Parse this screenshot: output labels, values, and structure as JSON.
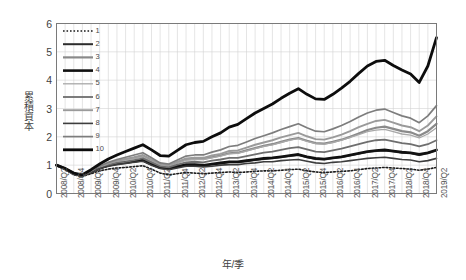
{
  "chart_data": {
    "type": "line",
    "title": "",
    "xlabel": "年/季",
    "ylabel": "累積資本",
    "ylim": [
      0,
      6
    ],
    "yticks": [
      0,
      1,
      2,
      3,
      4,
      5,
      6
    ],
    "grid": true,
    "legend_position": "top-left inside plot",
    "x": [
      "2008/Q2",
      "2008/Q3",
      "2008/Q4",
      "2009/Q1",
      "2009/Q2",
      "2009/Q3",
      "2009/Q4",
      "2010/Q1",
      "2010/Q2",
      "2010/Q3",
      "2010/Q4",
      "2011/Q1",
      "2011/Q2",
      "2011/Q3",
      "2011/Q4",
      "2012/Q1",
      "2012/Q2",
      "2012/Q3",
      "2012/Q4",
      "2013/Q1",
      "2013/Q2",
      "2013/Q3",
      "2013/Q4",
      "2014/Q1",
      "2014/Q2",
      "2014/Q3",
      "2014/Q4",
      "2015/Q1",
      "2015/Q2",
      "2015/Q3",
      "2015/Q4",
      "2016/Q1",
      "2016/Q2",
      "2016/Q3",
      "2016/Q4",
      "2017/Q1",
      "2017/Q2",
      "2017/Q3",
      "2017/Q4",
      "2018/Q1",
      "2018/Q2",
      "2018/Q3",
      "2018/Q4",
      "2019/Q1",
      "2019/Q2"
    ],
    "xtick_labels": [
      "2008/Q2",
      "2008/Q4",
      "2009/Q2",
      "2009/Q4",
      "2010/Q2",
      "2010/Q4",
      "2011/Q2",
      "2011/Q4",
      "2012/Q2",
      "2012/Q4",
      "2013/Q2",
      "2013/Q4",
      "2014/Q2",
      "2014/Q4",
      "2015/Q2",
      "2015/Q4",
      "2016/Q2",
      "2016/Q4",
      "2017/Q2",
      "2017/Q4",
      "2018/Q2",
      "2018/Q4",
      "2019/Q2"
    ],
    "series": [
      {
        "name": "1",
        "style": "dotted",
        "color": "#1a1a1a",
        "width": 1.6,
        "values": [
          1.0,
          0.84,
          0.66,
          0.6,
          0.7,
          0.8,
          0.86,
          0.9,
          0.92,
          0.95,
          0.98,
          0.86,
          0.72,
          0.66,
          0.7,
          0.74,
          0.72,
          0.7,
          0.72,
          0.74,
          0.76,
          0.74,
          0.76,
          0.78,
          0.8,
          0.8,
          0.82,
          0.84,
          0.86,
          0.8,
          0.76,
          0.74,
          0.76,
          0.78,
          0.8,
          0.84,
          0.88,
          0.9,
          0.92,
          0.9,
          0.88,
          0.86,
          0.82,
          0.86,
          0.92
        ]
      },
      {
        "name": "2",
        "style": "solid",
        "color": "#2d2d2d",
        "width": 2.0,
        "values": [
          1.0,
          0.86,
          0.68,
          0.62,
          0.74,
          0.88,
          0.98,
          1.04,
          1.08,
          1.12,
          1.16,
          1.02,
          0.9,
          0.86,
          0.94,
          1.0,
          1.0,
          0.98,
          1.02,
          1.06,
          1.1,
          1.1,
          1.14,
          1.18,
          1.22,
          1.24,
          1.28,
          1.32,
          1.36,
          1.28,
          1.22,
          1.2,
          1.24,
          1.28,
          1.34,
          1.4,
          1.46,
          1.5,
          1.52,
          1.48,
          1.44,
          1.42,
          1.36,
          1.42,
          1.52
        ]
      },
      {
        "name": "3",
        "style": "solid",
        "color": "#8a8a8a",
        "width": 2.2,
        "values": [
          1.0,
          0.87,
          0.7,
          0.64,
          0.78,
          0.94,
          1.06,
          1.14,
          1.2,
          1.26,
          1.32,
          1.16,
          1.02,
          0.98,
          1.1,
          1.2,
          1.22,
          1.22,
          1.28,
          1.34,
          1.42,
          1.44,
          1.52,
          1.6,
          1.68,
          1.74,
          1.82,
          1.9,
          1.96,
          1.86,
          1.78,
          1.76,
          1.82,
          1.9,
          2.0,
          2.12,
          2.24,
          2.32,
          2.36,
          2.28,
          2.2,
          2.16,
          2.04,
          2.2,
          2.46
        ]
      },
      {
        "name": "4",
        "style": "solid",
        "color": "#111111",
        "width": 2.6,
        "values": [
          1.0,
          0.88,
          0.7,
          0.64,
          0.76,
          0.9,
          1.0,
          1.06,
          1.1,
          1.14,
          1.18,
          1.04,
          0.92,
          0.88,
          0.96,
          1.02,
          1.02,
          1.0,
          1.04,
          1.08,
          1.12,
          1.12,
          1.16,
          1.2,
          1.24,
          1.26,
          1.3,
          1.34,
          1.38,
          1.3,
          1.24,
          1.22,
          1.26,
          1.3,
          1.36,
          1.42,
          1.48,
          1.52,
          1.54,
          1.5,
          1.46,
          1.44,
          1.38,
          1.44,
          1.54
        ]
      },
      {
        "name": "5",
        "style": "solid",
        "color": "#a8a8a8",
        "width": 1.3,
        "values": [
          1.0,
          0.87,
          0.69,
          0.63,
          0.77,
          0.92,
          1.04,
          1.12,
          1.18,
          1.24,
          1.3,
          1.14,
          1.0,
          0.96,
          1.08,
          1.18,
          1.2,
          1.2,
          1.26,
          1.32,
          1.4,
          1.42,
          1.5,
          1.58,
          1.66,
          1.72,
          1.8,
          1.88,
          1.94,
          1.84,
          1.76,
          1.74,
          1.8,
          1.88,
          1.98,
          2.08,
          2.18,
          2.24,
          2.26,
          2.18,
          2.1,
          2.06,
          1.96,
          2.1,
          2.32
        ]
      },
      {
        "name": "6",
        "style": "solid",
        "color": "#6e6e6e",
        "width": 1.8,
        "values": [
          1.0,
          0.86,
          0.68,
          0.62,
          0.75,
          0.9,
          1.0,
          1.08,
          1.12,
          1.18,
          1.24,
          1.1,
          0.96,
          0.92,
          1.02,
          1.1,
          1.12,
          1.1,
          1.16,
          1.2,
          1.26,
          1.26,
          1.32,
          1.38,
          1.44,
          1.48,
          1.54,
          1.6,
          1.64,
          1.56,
          1.48,
          1.46,
          1.52,
          1.58,
          1.66,
          1.74,
          1.82,
          1.88,
          1.9,
          1.84,
          1.78,
          1.74,
          1.66,
          1.74,
          1.88
        ]
      },
      {
        "name": "7",
        "style": "solid",
        "color": "#9a9a9a",
        "width": 1.9,
        "values": [
          1.0,
          0.87,
          0.7,
          0.64,
          0.78,
          0.94,
          1.06,
          1.16,
          1.22,
          1.28,
          1.36,
          1.2,
          1.04,
          1.0,
          1.12,
          1.24,
          1.26,
          1.26,
          1.34,
          1.4,
          1.5,
          1.52,
          1.62,
          1.72,
          1.8,
          1.88,
          1.98,
          2.06,
          2.14,
          2.02,
          1.92,
          1.9,
          1.98,
          2.08,
          2.2,
          2.34,
          2.46,
          2.56,
          2.6,
          2.5,
          2.4,
          2.34,
          2.2,
          2.4,
          2.72
        ]
      },
      {
        "name": "8",
        "style": "solid",
        "color": "#3d3d3d",
        "width": 1.6,
        "values": [
          1.0,
          0.86,
          0.68,
          0.62,
          0.74,
          0.88,
          0.96,
          1.02,
          1.06,
          1.1,
          1.14,
          1.0,
          0.88,
          0.84,
          0.9,
          0.96,
          0.96,
          0.94,
          0.96,
          1.0,
          1.02,
          1.02,
          1.06,
          1.08,
          1.12,
          1.12,
          1.16,
          1.18,
          1.2,
          1.14,
          1.08,
          1.06,
          1.1,
          1.12,
          1.16,
          1.2,
          1.24,
          1.26,
          1.28,
          1.24,
          1.2,
          1.18,
          1.12,
          1.16,
          1.24
        ]
      },
      {
        "name": "9",
        "style": "solid",
        "color": "#7d7d7d",
        "width": 1.7,
        "values": [
          1.0,
          0.87,
          0.7,
          0.64,
          0.79,
          0.96,
          1.1,
          1.2,
          1.28,
          1.36,
          1.44,
          1.26,
          1.08,
          1.04,
          1.18,
          1.32,
          1.36,
          1.36,
          1.46,
          1.54,
          1.66,
          1.7,
          1.82,
          1.94,
          2.04,
          2.14,
          2.26,
          2.36,
          2.46,
          2.32,
          2.2,
          2.18,
          2.28,
          2.4,
          2.54,
          2.7,
          2.84,
          2.94,
          2.98,
          2.86,
          2.74,
          2.66,
          2.5,
          2.74,
          3.1
        ]
      },
      {
        "name": "10",
        "style": "solid",
        "color": "#0d0d0d",
        "width": 2.8,
        "values": [
          1.0,
          0.88,
          0.72,
          0.66,
          0.84,
          1.04,
          1.22,
          1.36,
          1.48,
          1.6,
          1.72,
          1.54,
          1.34,
          1.32,
          1.52,
          1.72,
          1.8,
          1.84,
          2.0,
          2.14,
          2.34,
          2.44,
          2.64,
          2.84,
          3.0,
          3.16,
          3.36,
          3.54,
          3.7,
          3.5,
          3.34,
          3.32,
          3.5,
          3.72,
          3.96,
          4.24,
          4.5,
          4.66,
          4.7,
          4.52,
          4.36,
          4.22,
          3.92,
          4.5,
          5.5
        ]
      }
    ]
  },
  "legend": {
    "items": [
      {
        "label": "1"
      },
      {
        "label": "2"
      },
      {
        "label": "3"
      },
      {
        "label": "4"
      },
      {
        "label": "5"
      },
      {
        "label": "6"
      },
      {
        "label": "7"
      },
      {
        "label": "8"
      },
      {
        "label": "9"
      },
      {
        "label": "10"
      }
    ]
  }
}
